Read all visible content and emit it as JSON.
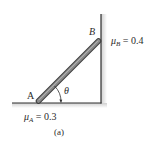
{
  "figure": {
    "caption": "(a)",
    "angle_symbol": "θ",
    "point_a": {
      "label": "A",
      "coefficient_symbol": "μ",
      "coefficient_subscript": "A",
      "equals": " = ",
      "coefficient_value": "0.3"
    },
    "point_b": {
      "label": "B",
      "coefficient_symbol": "μ",
      "coefficient_subscript": "B",
      "equals": " = ",
      "coefficient_value": "0.4"
    },
    "colors": {
      "rod_fill": "#8c8c8c",
      "rod_outline": "#3a3a3a",
      "surface_line": "#2e2e2e",
      "shadow": "#d4d4d4"
    }
  }
}
